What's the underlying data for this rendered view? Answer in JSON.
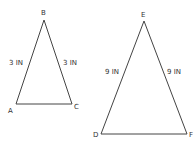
{
  "diagram": {
    "type": "similar-triangles",
    "line_color": "#444444",
    "triangles": [
      {
        "name": "ABC",
        "vertices": {
          "A": {
            "label": "A",
            "x": 16,
            "y": 104
          },
          "B": {
            "label": "B",
            "x": 44,
            "y": 20
          },
          "C": {
            "label": "C",
            "x": 72,
            "y": 104
          }
        },
        "side_labels": {
          "AB": "3 IN",
          "BC": "3 IN"
        }
      },
      {
        "name": "DEF",
        "vertices": {
          "D": {
            "label": "D",
            "x": 101,
            "y": 134
          },
          "E": {
            "label": "E",
            "x": 144,
            "y": 21
          },
          "F": {
            "label": "F",
            "x": 187,
            "y": 134
          }
        },
        "side_labels": {
          "DE": "9 IN",
          "EF": "9 IN"
        }
      }
    ]
  }
}
